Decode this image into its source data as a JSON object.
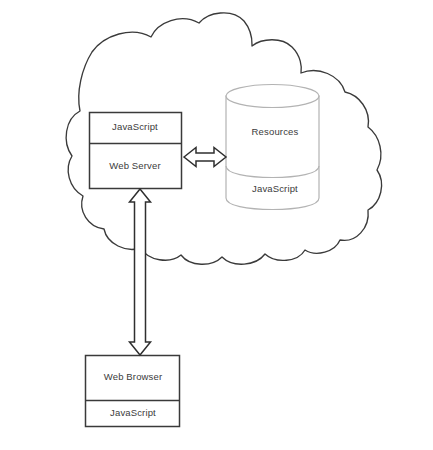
{
  "diagram": {
    "canvas": {
      "width": 433,
      "height": 450,
      "background": "#ffffff"
    },
    "colors": {
      "box_stroke": "#3a3a3a",
      "cloud_stroke": "#3a3a3a",
      "cylinder_stroke": "#b3b3b3",
      "arrow_stroke": "#2f2f2f",
      "arrow_fill": "#ffffff",
      "text": "#3b3b3b"
    },
    "groups": [
      {
        "name": "cloud",
        "shape": "cloud",
        "label": "",
        "contains": [
          "web-server",
          "database"
        ]
      }
    ],
    "nodes": [
      {
        "id": "web-server",
        "shape": "rectangle",
        "compartments": [
          {
            "id": "web-server-javascript",
            "label": "JavaScript"
          },
          {
            "id": "web-server-main",
            "label": "Web Server"
          }
        ]
      },
      {
        "id": "database",
        "shape": "cylinder",
        "compartments": [
          {
            "id": "database-resources",
            "label": "Resources"
          },
          {
            "id": "database-javascript",
            "label": "JavaScript"
          }
        ]
      },
      {
        "id": "web-browser",
        "shape": "rectangle",
        "compartments": [
          {
            "id": "web-browser-main",
            "label": "Web Browser"
          },
          {
            "id": "web-browser-javascript",
            "label": "JavaScript"
          }
        ]
      }
    ],
    "connectors": [
      {
        "id": "server-database-link",
        "from": "web-server",
        "to": "database",
        "orientation": "horizontal",
        "arrowheads": "both",
        "style": "block-outline"
      },
      {
        "id": "server-browser-link",
        "from": "web-server",
        "to": "web-browser",
        "orientation": "vertical",
        "arrowheads": "both",
        "style": "block-outline"
      }
    ]
  }
}
